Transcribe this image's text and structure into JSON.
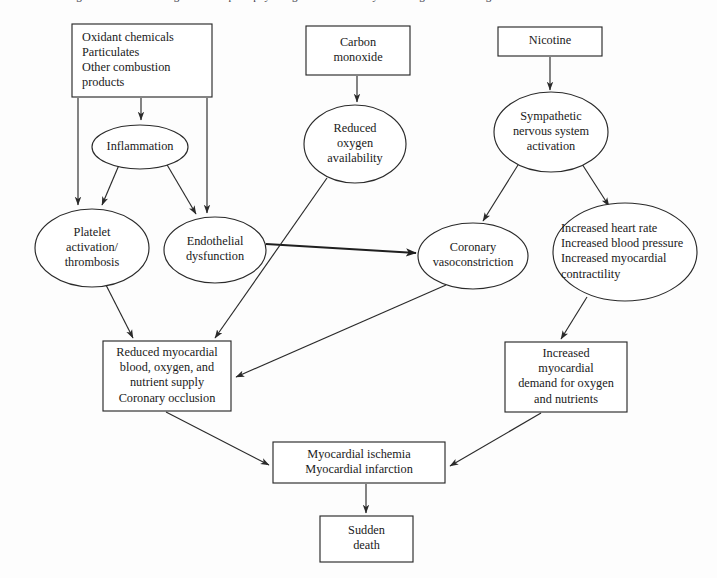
{
  "caption": {
    "text": "Figure 1.  Schematic diagram of the pathophysiologic mechanisms by which cigarette smoking causes acute cardiovascular events"
  },
  "diagram": {
    "colors": {
      "background": "#fdfdfd",
      "stroke": "#2a2a2a",
      "fill": "#ffffff",
      "text": "#1a1a1a"
    },
    "nodes": [
      {
        "id": "oxidants",
        "shape": "rect",
        "align": "left",
        "x": 72,
        "y": 24,
        "w": 140,
        "h": 73,
        "lines": [
          "Oxidant chemicals",
          "Particulates",
          "Other combustion",
          "   products"
        ]
      },
      {
        "id": "carbon-monoxide",
        "shape": "rect",
        "align": "center",
        "x": 306,
        "y": 26,
        "w": 104,
        "h": 49,
        "lines": [
          "Carbon",
          "monoxide"
        ]
      },
      {
        "id": "nicotine",
        "shape": "rect",
        "align": "center",
        "x": 498,
        "y": 27,
        "w": 104,
        "h": 29,
        "lines": [
          "Nicotine"
        ]
      },
      {
        "id": "inflammation",
        "shape": "ellipse",
        "align": "center",
        "cx": 140,
        "cy": 147,
        "rx": 48,
        "ry": 22,
        "lines": [
          "Inflammation"
        ]
      },
      {
        "id": "reduced-oxygen",
        "shape": "ellipse",
        "align": "center",
        "cx": 355,
        "cy": 144,
        "rx": 51,
        "ry": 39,
        "lines": [
          "Reduced",
          "oxygen",
          "availability"
        ]
      },
      {
        "id": "sympathetic",
        "shape": "ellipse",
        "align": "center",
        "cx": 551,
        "cy": 132,
        "rx": 57,
        "ry": 40,
        "lines": [
          "Sympathetic",
          "nervous system",
          "activation"
        ]
      },
      {
        "id": "platelet",
        "shape": "ellipse",
        "align": "center",
        "cx": 92,
        "cy": 248,
        "rx": 57,
        "ry": 39,
        "lines": [
          "Platelet",
          "activation/",
          "thrombosis"
        ]
      },
      {
        "id": "endothelial",
        "shape": "ellipse",
        "align": "center",
        "cx": 215,
        "cy": 250,
        "rx": 51,
        "ry": 33,
        "lines": [
          "Endothelial",
          "dysfunction"
        ]
      },
      {
        "id": "coronary-vasoconstriction",
        "shape": "ellipse",
        "align": "center",
        "cx": 473,
        "cy": 256,
        "rx": 55,
        "ry": 33,
        "lines": [
          "Coronary",
          "vasoconstriction"
        ]
      },
      {
        "id": "increased-rate",
        "shape": "ellipse",
        "align": "left",
        "cx": 625,
        "cy": 252,
        "rx": 72,
        "ry": 49,
        "textx": 561,
        "lines": [
          "Increased heart rate",
          "Increased blood pressure",
          "Increased myocardial",
          "contractility"
        ]
      },
      {
        "id": "reduced-supply",
        "shape": "rect",
        "align": "center",
        "x": 103,
        "y": 341,
        "w": 128,
        "h": 70,
        "lines": [
          "Reduced myocardial",
          "blood, oxygen, and",
          "nutrient supply",
          "Coronary occlusion"
        ]
      },
      {
        "id": "increased-demand",
        "shape": "rect",
        "align": "center",
        "x": 505,
        "y": 342,
        "w": 122,
        "h": 70,
        "lines": [
          "Increased",
          "myocardial",
          "demand for oxygen",
          "and nutrients"
        ]
      },
      {
        "id": "ischemia",
        "shape": "rect",
        "align": "center",
        "x": 273,
        "y": 442,
        "w": 172,
        "h": 41,
        "lines": [
          "Myocardial ischemia",
          "Myocardial infarction"
        ]
      },
      {
        "id": "sudden-death",
        "shape": "rect",
        "align": "center",
        "x": 320,
        "y": 516,
        "w": 93,
        "h": 46,
        "lines": [
          "Sudden",
          "death"
        ]
      }
    ],
    "edges": [
      {
        "id": "oxidants-to-inflammation",
        "from": "oxidants",
        "to": "inflammation",
        "path": "M 141 98 L 141 120"
      },
      {
        "id": "oxidants-to-platelet",
        "from": "oxidants",
        "to": "platelet",
        "path": "M 78 98 L 78 205"
      },
      {
        "id": "oxidants-to-endothelial",
        "from": "oxidants",
        "to": "endothelial",
        "path": "M 207 98 L 207 213"
      },
      {
        "id": "inflammation-to-platelet",
        "from": "inflammation",
        "to": "platelet",
        "path": "M 119 165 L 102 205"
      },
      {
        "id": "inflammation-to-endothelial",
        "from": "inflammation",
        "to": "endothelial",
        "path": "M 166 163 L 196 214"
      },
      {
        "id": "carbon-monoxide-to-reduced-oxygen",
        "from": "carbon-monoxide",
        "to": "reduced-oxygen",
        "path": "M 357 76 L 357 102"
      },
      {
        "id": "nicotine-to-sympathetic",
        "from": "nicotine",
        "to": "sympathetic",
        "path": "M 550 57 L 550 90"
      },
      {
        "id": "sympathetic-to-coronary",
        "from": "sympathetic",
        "to": "coronary-vasoconstriction",
        "path": "M 518 165 L 483 221"
      },
      {
        "id": "sympathetic-to-increased-rate",
        "from": "sympathetic",
        "to": "increased-rate",
        "path": "M 582 164 L 609 206"
      },
      {
        "id": "endothelial-to-coronary",
        "from": "endothelial",
        "to": "coronary-vasoconstriction",
        "path": "M 266 244 L 416 253",
        "thick": true
      },
      {
        "id": "platelet-to-reduced-supply",
        "from": "platelet",
        "to": "reduced-supply",
        "path": "M 106 285 L 133 338"
      },
      {
        "id": "reduced-oxygen-to-reduced-supply",
        "from": "reduced-oxygen",
        "to": "reduced-supply",
        "path": "M 327 178 L 215 338"
      },
      {
        "id": "coronary-to-reduced-supply",
        "from": "coronary-vasoconstriction",
        "to": "reduced-supply",
        "path": "M 446 285 L 236 377"
      },
      {
        "id": "increased-rate-to-demand",
        "from": "increased-rate",
        "to": "increased-demand",
        "path": "M 587 297 L 561 339"
      },
      {
        "id": "reduced-supply-to-ischemia",
        "from": "reduced-supply",
        "to": "ischemia",
        "path": "M 166 412 L 269 465"
      },
      {
        "id": "demand-to-ischemia",
        "from": "increased-demand",
        "to": "ischemia",
        "path": "M 541 413 L 450 466"
      },
      {
        "id": "ischemia-to-sudden-death",
        "from": "ischemia",
        "to": "sudden-death",
        "path": "M 366 484 L 366 513"
      }
    ]
  }
}
